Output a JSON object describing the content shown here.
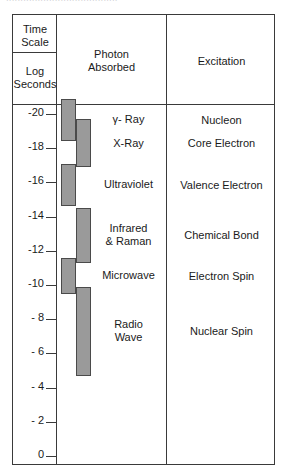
{
  "scan_fragment": "·······································",
  "header": {
    "time_scale_line1": "Time",
    "time_scale_line2": "Scale",
    "log_seconds_line1": "Log",
    "log_seconds_line2": "Seconds",
    "photon_line1": "Photon",
    "photon_line2": "Absorbed",
    "excitation": "Excitation"
  },
  "colors": {
    "border": "#3a3a3a",
    "bar_fill": "#9a9a9a",
    "bar_stroke": "#4a4a4a",
    "text": "#1a1a1a",
    "background": "#ffffff"
  },
  "chart_data": {
    "type": "bar",
    "orientation": "vertical-log-axis",
    "xlabel": "",
    "ylabel": "Log Seconds",
    "ylim": [
      -21,
      0
    ],
    "grid": false,
    "legend": null,
    "axis": {
      "name": "Log Seconds",
      "tick_labels": [
        "-20",
        "-18",
        "-16",
        "-14",
        "-12",
        "-10",
        "- 8",
        "- 6",
        "- 4",
        "- 2",
        "0"
      ],
      "tick_values": [
        -20,
        -18,
        -16,
        -14,
        -12,
        -10,
        -8,
        -6,
        -4,
        -2,
        0
      ]
    },
    "bands": [
      {
        "photon": "γ- Ray",
        "excitation": "Nucleon",
        "log_seconds_range": [
          -20.9,
          -18.4
        ],
        "track": "a"
      },
      {
        "photon": "X-Ray",
        "excitation": "Core Electron",
        "log_seconds_range": [
          -19.7,
          -16.9
        ],
        "track": "b"
      },
      {
        "photon": "Ultraviolet",
        "excitation": "Valence Electron",
        "log_seconds_range": [
          -17.1,
          -14.6
        ],
        "track": "a"
      },
      {
        "photon": "Infrared & Raman",
        "excitation": "Chemical Bond",
        "log_seconds_range": [
          -14.5,
          -11.3
        ],
        "track": "b"
      },
      {
        "photon": "Microwave",
        "excitation": "Electron Spin",
        "log_seconds_range": [
          -11.6,
          -9.5
        ],
        "track": "a"
      },
      {
        "photon": "Radio Wave",
        "excitation": "Nuclear Spin",
        "log_seconds_range": [
          -9.9,
          -4.7
        ],
        "track": "b"
      }
    ],
    "band_labels": [
      {
        "text": "γ- Ray"
      },
      {
        "text": "X-Ray"
      },
      {
        "text": "Ultraviolet"
      },
      {
        "text_line1": "Infrared",
        "text_line2": "& Raman"
      },
      {
        "text": "Microwave"
      },
      {
        "text_line1": "Radio",
        "text_line2": "Wave"
      }
    ],
    "excitation_labels": [
      "Nucleon",
      "Core Electron",
      "Valence Electron",
      "Chemical Bond",
      "Electron Spin",
      "Nuclear Spin"
    ]
  }
}
